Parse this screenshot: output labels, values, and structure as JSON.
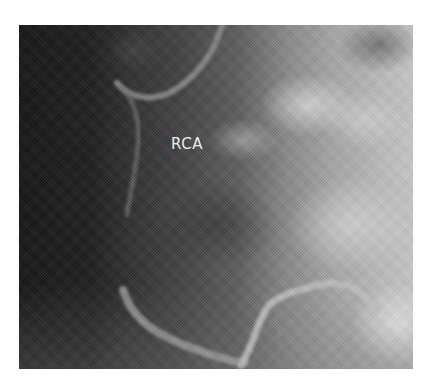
{
  "figure": {
    "type": "coronary angiogram",
    "colormap": "grayscale",
    "label": "RCA",
    "label_color": "#ececec",
    "tones": {
      "dark": "#141414",
      "mid": "#5c5c5c",
      "bright": "#c8c8c8",
      "vessel": "#9a9a9a"
    }
  }
}
